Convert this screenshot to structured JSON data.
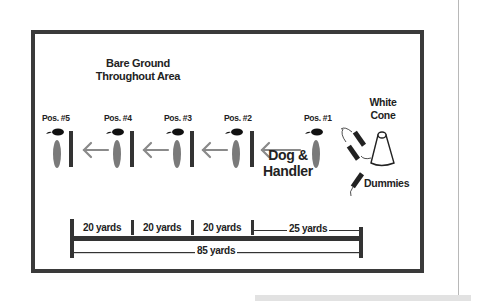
{
  "diagram": {
    "title_line1": "Bare Ground",
    "title_line2": "Throughout Area",
    "positions": [
      {
        "label": "Pos. #5"
      },
      {
        "label": "Pos. #4"
      },
      {
        "label": "Pos. #3"
      },
      {
        "label": "Pos. #2"
      },
      {
        "label": "Pos. #1"
      }
    ],
    "dog_handler_line1": "Dog &",
    "dog_handler_line2": "Handler",
    "white_cone_line1": "White",
    "white_cone_line2": "Cone",
    "dummies_label": "Dummies",
    "scale": {
      "segments": [
        "20 yards",
        "20 yards",
        "20 yards",
        "25 yards"
      ],
      "total": "85 yards"
    },
    "colors": {
      "frame": "#3a3a3a",
      "handler": "#7a7a7a",
      "dog": "#111111",
      "arrow": "#8a8a8a",
      "bar": "#333333"
    }
  }
}
